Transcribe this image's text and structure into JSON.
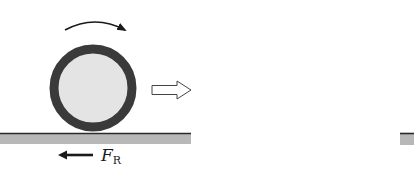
{
  "diagram": {
    "type": "rolling-wheel-friction",
    "rotation_direction": "clockwise",
    "motion_direction": "right",
    "friction_force": {
      "symbol": "F",
      "subscript": "R",
      "direction": "left"
    },
    "colors": {
      "wheel_rim": "#3a3a3a",
      "wheel_fill": "#e4e4e4",
      "ground_fill": "#b8b8b8",
      "ground_line": "#2a2a2a",
      "arrow": "#1a1a1a",
      "background": "#ffffff"
    }
  }
}
